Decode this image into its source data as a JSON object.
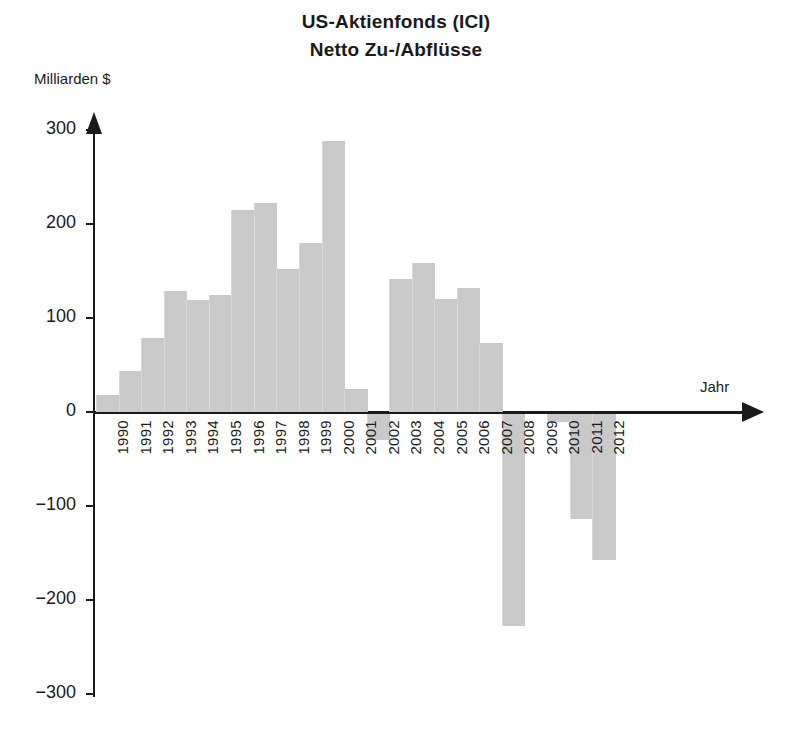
{
  "chart_data": {
    "type": "bar",
    "title": "US-Aktienfonds (ICI) Netto Zu-/Abflüsse",
    "title_line1": "US-Aktienfonds (ICI)",
    "title_line2": "Netto Zu-/Abflüsse",
    "xlabel": "Jahr",
    "ylabel": "Milliarden $",
    "ylim": [
      -300,
      300
    ],
    "yticks": [
      300,
      200,
      100,
      0,
      -100,
      -200,
      -300
    ],
    "ytick_labels": [
      "300",
      "200",
      "100",
      "0",
      "−100",
      "−200",
      "−300"
    ],
    "grid": false,
    "legend": "none",
    "bar_color": "#c9c9c9",
    "axis_color": "#1a1a1a",
    "categories": [
      "1990",
      "1991",
      "1992",
      "1993",
      "1994",
      "1995",
      "1996",
      "1997",
      "1998",
      "1999",
      "2000",
      "2001",
      "2002",
      "2003",
      "2004",
      "2005",
      "2006",
      "2007",
      "2008",
      "2009",
      "2010",
      "2011",
      "2012"
    ],
    "values": [
      18,
      44,
      79,
      129,
      119,
      124,
      215,
      222,
      152,
      180,
      288,
      25,
      -28,
      141,
      158,
      120,
      132,
      73,
      -225,
      0,
      -8,
      -112,
      -155
    ]
  },
  "footer": {}
}
